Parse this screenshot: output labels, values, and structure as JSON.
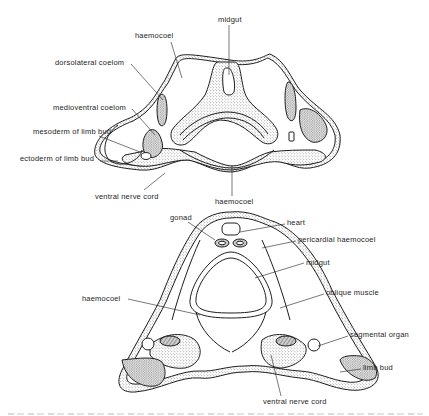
{
  "figure": {
    "top_section": {
      "labels": {
        "haemocoel_upper": "haemocoel",
        "midgut": "midgut",
        "dorsolateral_coelom": "dorsolateral coelom",
        "medioventral_coelom": "medioventral coelom",
        "mesoderm_of_limb_bud": "mesoderm of limb bud",
        "ectoderm_of_limb_bud": "ectoderm of limb bud",
        "ventral_nerve_cord": "ventral nerve cord",
        "haemocoel_lower": "haemocoel"
      }
    },
    "bottom_section": {
      "labels": {
        "gonad": "gonad",
        "heart": "heart",
        "pericardial_haemocoel": "pericardial haemocoel",
        "midgut": "midgut",
        "oblique_muscle": "oblique muscle",
        "haemocoel": "haemocoel",
        "segmental_organ": "segmental organ",
        "limb_bud": "limb bud",
        "ventral_nerve_cord": "ventral nerve cord"
      }
    },
    "caption": {
      "visible": "cropped"
    },
    "colors": {
      "ink": "#1e1e1e",
      "stipple_fill": "#d9d9d9",
      "background": "#ffffff"
    }
  }
}
